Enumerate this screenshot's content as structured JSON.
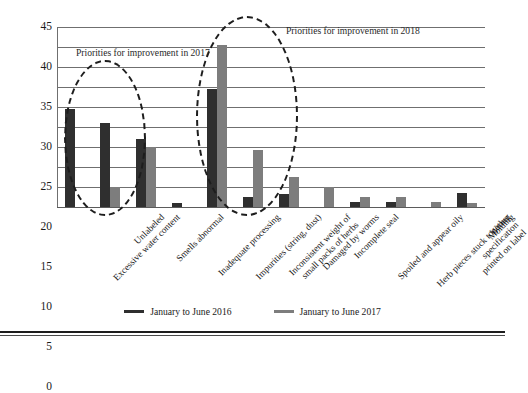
{
  "chart_data": {
    "type": "bar",
    "title": "",
    "xlabel": "",
    "ylabel": "",
    "ylim": [
      0,
      45
    ],
    "yticks": [
      0,
      5,
      10,
      15,
      20,
      25,
      30,
      35,
      40,
      45
    ],
    "grid": true,
    "legend_position": "bottom",
    "categories": [
      "Excessive water content",
      "Unlabeled",
      "Smells abnormal",
      "Inadequate processing",
      "Impurities (string, dust)",
      "Inconsistent weight of\nsmall packs of herbs",
      "Damaged by worms",
      "Incomplete seal",
      "Spoiled and appear oily",
      "Herb pieces stuck together",
      "Wrong specification\nprinted on label",
      "Molding"
    ],
    "series": [
      {
        "name": "January to June 2016",
        "color": "#2f2f2f",
        "values": [
          24.4,
          21.0,
          17.0,
          1.1,
          29.5,
          2.5,
          3.3,
          0,
          1.3,
          1.3,
          0,
          3.5
        ]
      },
      {
        "name": "January to June 2017",
        "color": "#7d7d7d",
        "values": [
          0,
          4.9,
          15.1,
          0,
          40.5,
          14.3,
          7.4,
          5.0,
          2.5,
          2.5,
          1.3,
          1.1
        ]
      }
    ],
    "annotations": [
      {
        "id": "annot-2017",
        "text": "Priorities for improvement in 2017",
        "shape": "dashed-ellipse",
        "covers": [
          "Excessive water content",
          "Unlabeled"
        ]
      },
      {
        "id": "annot-2018",
        "text": "Priorities for improvement in 2018",
        "shape": "dashed-ellipse",
        "covers": [
          "Impurities (string, dust)",
          "Inconsistent weight of small packs of herbs"
        ]
      }
    ]
  },
  "legend": {
    "items": [
      {
        "label": "January to June 2016"
      },
      {
        "label": "January to June 2017"
      }
    ]
  }
}
